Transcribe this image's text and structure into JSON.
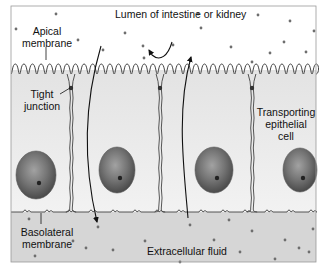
{
  "diagram": {
    "frame": {
      "x": 11,
      "y": 6,
      "w": 305,
      "h": 256,
      "stroke": "#9a9a9a"
    },
    "colors": {
      "lumen": "#ffffff",
      "cell": "#ebebeb",
      "cell_highlight": "#f4f4f4",
      "ecf": "#d6d6d6",
      "membrane": "#444444",
      "nucleus_outer": "#5a5a5a",
      "nucleus_inner": "#8a8a8a",
      "nucleolus": "#222222",
      "dot": "#6e6e6e",
      "arrow": "#111111",
      "text": "#111111"
    },
    "regions": {
      "microvilli_top": 58,
      "microvilli_bottom": 74,
      "basolateral_y": 212,
      "bottom": 262
    },
    "cell_boundaries_x": [
      71,
      160,
      252
    ],
    "tight_junction_y": 88,
    "nuclei": [
      {
        "cx": 36,
        "cy": 175,
        "rx": 20,
        "ry": 24
      },
      {
        "cx": 117,
        "cy": 170,
        "rx": 18,
        "ry": 23
      },
      {
        "cx": 214,
        "cy": 170,
        "rx": 19,
        "ry": 23
      },
      {
        "cx": 300,
        "cy": 170,
        "rx": 17,
        "ry": 22
      }
    ],
    "lumen_dots": [
      [
        56,
        14
      ],
      [
        16,
        29
      ],
      [
        78,
        40
      ],
      [
        125,
        33
      ],
      [
        103,
        50
      ],
      [
        143,
        46
      ],
      [
        198,
        14
      ],
      [
        258,
        15
      ],
      [
        290,
        21
      ],
      [
        314,
        31
      ],
      [
        201,
        28
      ],
      [
        231,
        47
      ],
      [
        173,
        45
      ],
      [
        284,
        42
      ],
      [
        270,
        53
      ],
      [
        306,
        52
      ],
      [
        144,
        58
      ],
      [
        252,
        62
      ]
    ],
    "ecf_dots": [
      [
        29,
        219
      ],
      [
        98,
        227
      ],
      [
        73,
        241
      ],
      [
        35,
        256
      ],
      [
        86,
        248
      ],
      [
        113,
        250
      ],
      [
        190,
        225
      ],
      [
        229,
        220
      ],
      [
        252,
        231
      ],
      [
        214,
        240
      ],
      [
        240,
        252
      ],
      [
        285,
        240
      ],
      [
        275,
        259
      ],
      [
        313,
        229
      ],
      [
        299,
        248
      ],
      [
        145,
        241
      ],
      [
        180,
        262
      ],
      [
        309,
        252
      ]
    ],
    "arrows": [
      {
        "name": "transcellular-arrow-down",
        "path": "M101 46 C 88 90, 80 150, 97 222",
        "head_at": "end"
      },
      {
        "name": "paracellular-arrow-up",
        "path": "M188 218 C 184 170, 176 110, 191 57",
        "head_at": "end"
      },
      {
        "name": "recycle-arrow",
        "path": "M172 42 C 168 56, 160 62, 152 55 L 149 50",
        "head_at": "end"
      }
    ],
    "labels": {
      "lumen": "Lumen of intestine or kidney",
      "apical_line1": "Apical",
      "apical_line2": "membrane",
      "tight_line1": "Tight",
      "tight_line2": "junction",
      "transporting_line1": "Transporting",
      "transporting_line2": "epithelial",
      "transporting_line3": "cell",
      "basolateral_line1": "Basolateral",
      "basolateral_line2": "membrane",
      "ecf": "Extracellular fluid"
    }
  }
}
